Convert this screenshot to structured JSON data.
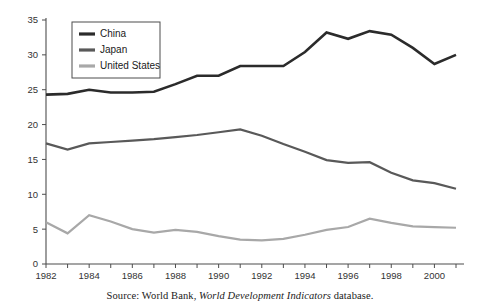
{
  "chart_data": {
    "type": "line",
    "title": "",
    "subtitle": "",
    "xlabel": "",
    "ylabel": "",
    "xlim": [
      1982,
      2001
    ],
    "ylim": [
      0,
      35
    ],
    "yticks": [
      0,
      5,
      10,
      15,
      20,
      25,
      30,
      35
    ],
    "xticks_major": [
      1982,
      1984,
      1986,
      1988,
      1990,
      1992,
      1994,
      1996,
      1998,
      2000
    ],
    "xticks_all": [
      1982,
      1983,
      1984,
      1985,
      1986,
      1987,
      1988,
      1989,
      1990,
      1991,
      1992,
      1993,
      1994,
      1995,
      1996,
      1997,
      1998,
      1999,
      2000,
      2001
    ],
    "grid": false,
    "legend_position": "top-left-inside",
    "x": [
      1982,
      1983,
      1984,
      1985,
      1986,
      1987,
      1988,
      1989,
      1990,
      1991,
      1992,
      1993,
      1994,
      1995,
      1996,
      1997,
      1998,
      1999,
      2000,
      2001
    ],
    "series": [
      {
        "name": "China",
        "color": "#2b2b2b",
        "width": 2.6,
        "values": [
          24.3,
          24.4,
          25.0,
          24.6,
          24.6,
          24.7,
          25.8,
          27.0,
          27.0,
          28.4,
          28.4,
          28.4,
          30.4,
          33.2,
          32.3,
          33.4,
          32.9,
          31.0,
          28.7,
          30.0
        ]
      },
      {
        "name": "Japan",
        "color": "#595959",
        "width": 2.2,
        "values": [
          17.3,
          16.4,
          17.3,
          17.5,
          17.7,
          17.9,
          18.2,
          18.5,
          18.9,
          19.3,
          18.4,
          17.2,
          16.1,
          14.9,
          14.5,
          14.6,
          13.1,
          12.0,
          11.6,
          10.8
        ]
      },
      {
        "name": "United States",
        "color": "#a8a8a8",
        "width": 2.2,
        "values": [
          6.0,
          4.4,
          7.0,
          6.1,
          5.0,
          4.5,
          4.9,
          4.6,
          4.0,
          3.5,
          3.4,
          3.6,
          4.2,
          4.9,
          5.3,
          6.5,
          5.9,
          5.4,
          5.3,
          5.2
        ]
      }
    ]
  },
  "legend": {
    "items": [
      {
        "label": "China",
        "color": "#2b2b2b"
      },
      {
        "label": "Japan",
        "color": "#595959"
      },
      {
        "label": "United States",
        "color": "#a8a8a8"
      }
    ]
  },
  "source": {
    "prefix": "Source: World Bank, ",
    "italic_title": "World Development Indicators",
    "suffix": " database."
  }
}
